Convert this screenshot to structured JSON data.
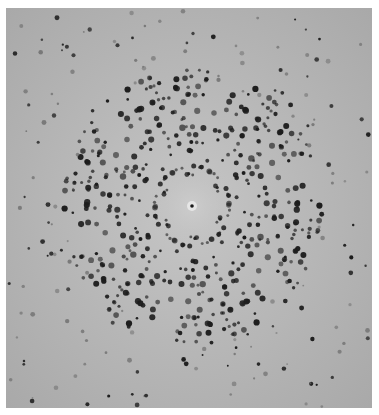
{
  "image": {
    "subject": "X-ray diffraction photograph of a crystal (spot pattern)",
    "caption": "X-ray diffraction pattern",
    "frame": {
      "x": 6,
      "y": 8,
      "width": 366,
      "height": 400,
      "border_color": "#ffffff"
    },
    "background": {
      "edge_color": "#a9a9a9",
      "mid_color": "#b8b8b8",
      "center_glow_color": "#c6c6c6"
    },
    "beam_center": {
      "x": 186,
      "y": 198,
      "spot_color": "#1a1a1a",
      "halo_color": "#e6e6e6",
      "clear_radius": 30
    },
    "spots": {
      "color": "#1c1c1c",
      "faint_color": "#6a6a6a",
      "symmetry_fold": 6,
      "dense_ring_inner": 32,
      "dense_ring_outer": 130,
      "sparse_ring_outer": 260,
      "dense_count": 520,
      "sparse_count": 260,
      "spiral_twist": 0.9,
      "seed": 7
    }
  }
}
